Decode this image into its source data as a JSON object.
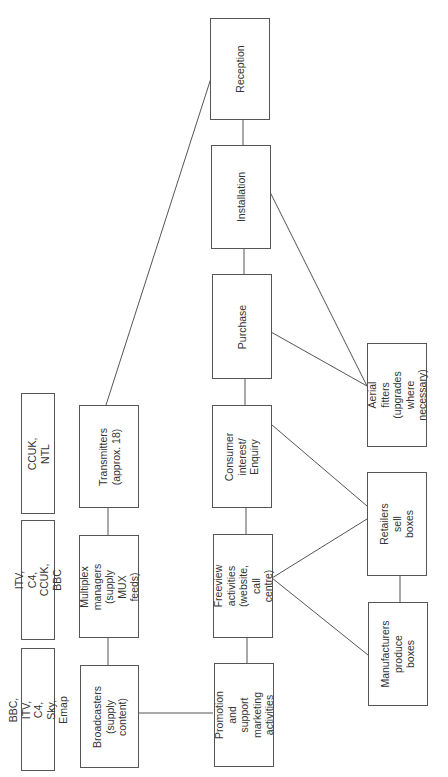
{
  "diagram": {
    "type": "flowchart",
    "orientation": "rotated-90-ccw",
    "owner_boxes": [
      {
        "id": "owners-broadcasters",
        "label": "BBC, ITV, C4, Sky, Emap"
      },
      {
        "id": "owners-multiplex",
        "label": "ITV, C4, CCUK, BBC"
      },
      {
        "id": "owners-transmitters",
        "label": "CCUK, NTL"
      }
    ],
    "supply_chain": [
      {
        "id": "transmitters",
        "label": "Transmitters\n(approx. 18)"
      },
      {
        "id": "multiplex",
        "label": "Multiplex\nmanagers (supply\nMUX feeds)"
      },
      {
        "id": "broadcasters",
        "label": "Broadcasters\n(supply content)"
      }
    ],
    "consumer_journey": [
      {
        "id": "reception",
        "label": "Reception"
      },
      {
        "id": "installation",
        "label": "Installation"
      },
      {
        "id": "purchase",
        "label": "Purchase"
      },
      {
        "id": "consumer-interest",
        "label": "Consumer interest/\nEnquiry"
      },
      {
        "id": "freeview",
        "label": "Freeview activities\n(website,\ncall centre)"
      },
      {
        "id": "promotion",
        "label": "Promotion and\nsupport marketing\nactivities"
      }
    ],
    "trade": [
      {
        "id": "aerial-fitters",
        "label": "Aerial fitters\n(upgrades where\nnecessary)"
      },
      {
        "id": "retailers",
        "label": "Retailers sell\nboxes"
      },
      {
        "id": "manufacturers",
        "label": "Manufacturers\nproduce boxes"
      }
    ],
    "edges": [
      [
        "broadcasters",
        "multiplex"
      ],
      [
        "multiplex",
        "transmitters"
      ],
      [
        "transmitters",
        "reception"
      ],
      [
        "reception",
        "installation"
      ],
      [
        "installation",
        "purchase"
      ],
      [
        "purchase",
        "consumer-interest"
      ],
      [
        "consumer-interest",
        "freeview"
      ],
      [
        "freeview",
        "promotion"
      ],
      [
        "broadcasters",
        "promotion"
      ],
      [
        "freeview",
        "retailers"
      ],
      [
        "freeview",
        "manufacturers"
      ],
      [
        "consumer-interest",
        "retailers"
      ],
      [
        "purchase",
        "aerial-fitters"
      ],
      [
        "installation",
        "aerial-fitters"
      ],
      [
        "retailers",
        "manufacturers"
      ]
    ],
    "colors": {
      "line": "#555555",
      "text": "#333333",
      "background": "#ffffff"
    }
  }
}
